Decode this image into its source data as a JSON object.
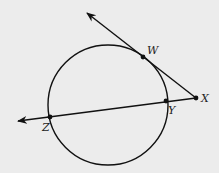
{
  "diagram": {
    "background": "#ececec",
    "stroke": "#111111",
    "circle": {
      "cx": 108,
      "cy": 105,
      "r": 60
    },
    "points": [
      {
        "id": "W",
        "label": "W",
        "x": 143,
        "y": 57,
        "lx": 147,
        "ly": 54
      },
      {
        "id": "X",
        "label": "X",
        "x": 196,
        "y": 98,
        "lx": 201,
        "ly": 102
      },
      {
        "id": "Y",
        "label": "Y",
        "x": 166,
        "y": 101,
        "lx": 168,
        "ly": 114
      },
      {
        "id": "Z",
        "label": "Z",
        "x": 50,
        "y": 117,
        "lx": 42,
        "ly": 131
      }
    ],
    "rays": [
      {
        "name": "ray-XW",
        "from": "X",
        "tip": [
          87,
          13
        ]
      },
      {
        "name": "ray-XZ",
        "from": "X",
        "tip": [
          18,
          121
        ]
      }
    ]
  }
}
